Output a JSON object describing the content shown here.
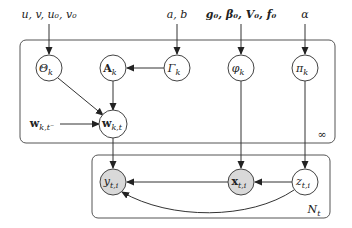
{
  "diagram": {
    "type": "graphical-model-plate-notation",
    "hyperparams": {
      "theta": "u, v, u₀, v₀",
      "gamma": "a, b",
      "phi": "g₀, β₀, V₀, f₀",
      "pi": "α"
    },
    "nodes": {
      "theta": "Θ",
      "theta_sub": "k",
      "A": "A",
      "A_sub": "k",
      "gamma": "Γ",
      "gamma_sub": "k",
      "phi": "φ",
      "phi_sub": "k",
      "pi": "π",
      "pi_sub": "k",
      "w": "w",
      "w_sub": "k,t",
      "w_prev": "w",
      "w_prev_sub": "k,t⁻",
      "y": "y",
      "y_sub": "t,i",
      "x": "x",
      "x_sub": "t,i",
      "z": "z",
      "z_sub": "t,i"
    },
    "plates": {
      "outer_label": "∞",
      "inner_label": "N",
      "inner_label_sub": "t"
    },
    "colors": {
      "observed_fill": "#d9d9d9",
      "latent_fill": "#ffffff",
      "stroke": "#444444"
    }
  }
}
